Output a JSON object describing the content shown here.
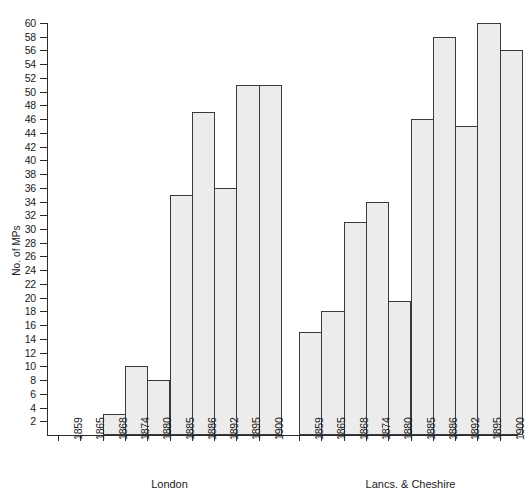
{
  "chart_data": {
    "type": "bar",
    "title": "",
    "xlabel": "",
    "ylabel": "No. of MPs",
    "ylim": [
      0,
      60
    ],
    "ytick_step": 2,
    "grid": false,
    "legend": false,
    "categories": [
      "1859",
      "1865",
      "1868",
      "1874",
      "1880",
      "1885",
      "1886",
      "1892",
      "1895",
      "1900"
    ],
    "yticks": [
      2,
      4,
      6,
      8,
      10,
      12,
      14,
      16,
      18,
      20,
      22,
      24,
      26,
      28,
      30,
      32,
      34,
      36,
      38,
      40,
      42,
      44,
      46,
      48,
      50,
      52,
      54,
      56,
      58,
      60
    ],
    "groups": [
      {
        "name": "London",
        "label": "London",
        "categories": [
          "1859",
          "1865",
          "1868",
          "1874",
          "1880",
          "1885",
          "1886",
          "1892",
          "1895",
          "1900"
        ],
        "values": [
          0,
          0,
          3,
          10,
          8,
          35,
          47,
          36,
          51,
          51
        ]
      },
      {
        "name": "Lancs. & Cheshire",
        "label": "Lancs. & Cheshire",
        "categories": [
          "1859",
          "1865",
          "1868",
          "1874",
          "1880",
          "1885",
          "1886",
          "1892",
          "1895",
          "1900"
        ],
        "values": [
          15,
          18,
          31,
          34,
          19.5,
          46,
          58,
          45,
          60,
          56
        ]
      }
    ],
    "colors": {
      "bar_fill": "#ececec",
      "bar_stroke": "#3a3a3a",
      "axis": "#2b2b2b",
      "text": "#1a1a1a"
    }
  }
}
